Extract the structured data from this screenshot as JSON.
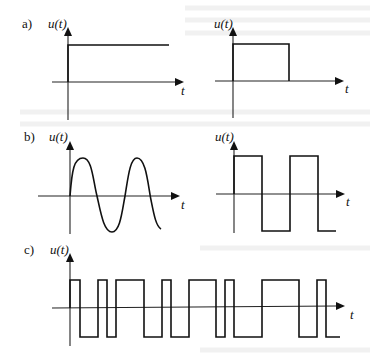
{
  "figure": {
    "panels": [
      {
        "id": "a-left",
        "label": "a)",
        "ylabel": "u(t)",
        "xlabel": "t",
        "signal": "step",
        "description": "constant level starting at t=0"
      },
      {
        "id": "a-right",
        "ylabel": "u(t)",
        "xlabel": "t",
        "signal": "rectangular-pulse",
        "description": "single pulse from t=0 that drops to zero"
      },
      {
        "id": "b-left",
        "label": "b)",
        "ylabel": "u(t)",
        "xlabel": "t",
        "signal": "sine",
        "description": "sinusoid starting at t=0, about two periods"
      },
      {
        "id": "b-right",
        "ylabel": "u(t)",
        "xlabel": "t",
        "signal": "square-wave",
        "description": "periodic bipolar square wave"
      },
      {
        "id": "c",
        "label": "c)",
        "ylabel": "u(t)",
        "xlabel": "t",
        "signal": "random-binary",
        "description": "random bipolar binary (telegraph) signal"
      }
    ]
  },
  "shapes": {
    "a_left_step": "M68,82 L68,45 L169,45",
    "a_right_pulse": "M233,81 L233,44 L289,44 L289,81",
    "b_left_sine": "M70,196 C72,170 74,158 83,158 C92,158 93,180 97,196 C101,214 104,232 112,232 C120,232 122,212 125,196 C128,178 130,158 137,158 C146,158 148,185 151,200 C154,215 156,226 161,229",
    "b_right_square": "M234,194 L234,156 L262,156 L262,231 L290,231 L290,156 L318,156 L318,231 L336,231",
    "c_binary": "M70,308 L70,280 L80,280 L80,337 L98,337 L98,280 L107,280 L107,337 L116,337 L116,280 L144,280 L144,337 L162,337 L162,280 L171,280 L171,337 L189,337 L189,280 L216,280 L216,337 L225,337 L225,280 L234,280 L234,337 L262,337 L262,280 L299,280 L299,337 L317,337 L317,280 L326,280 L326,337 L340,337"
  }
}
